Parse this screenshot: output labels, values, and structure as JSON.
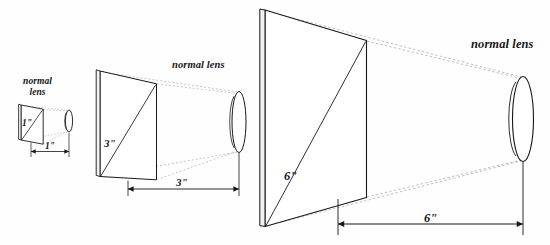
{
  "figure": {
    "type": "optical-diagram",
    "background_color": "#fefefe",
    "ink_color": "#17171a",
    "projection_line_color": "#b9b9bd",
    "panel_fill": "#ffffff"
  },
  "setups": [
    {
      "id": "one-inch",
      "lens_label": "normal\nlens",
      "lens_label_line1": "normal",
      "lens_label_line2": "lens",
      "diagonal_label": "1\"",
      "focal_length_label": "1\"",
      "diagonal_inches": 1,
      "focal_length_inches": 1
    },
    {
      "id": "three-inch",
      "lens_label": "normal lens",
      "diagonal_label": "3\"",
      "focal_length_label": "3\"",
      "diagonal_inches": 3,
      "focal_length_inches": 3
    },
    {
      "id": "six-inch",
      "lens_label": "normal lens",
      "diagonal_label": "6\"",
      "focal_length_label": "6\"",
      "diagonal_inches": 6,
      "focal_length_inches": 6
    }
  ]
}
